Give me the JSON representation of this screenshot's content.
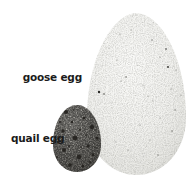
{
  "figure": {
    "labels": {
      "goose": "goose egg",
      "quail": "quail egg"
    },
    "colors": {
      "background": "#ffffff",
      "label_text": "#1b1b1b",
      "goose_egg_base": "#f2f1ee",
      "goose_egg_edge_shade": "#cfcfca",
      "quail_egg_highlight": "#c0beb8",
      "quail_egg_base": "#9b9993",
      "quail_egg_shade": "#63615b",
      "speckle_dark": "#24221e"
    }
  }
}
